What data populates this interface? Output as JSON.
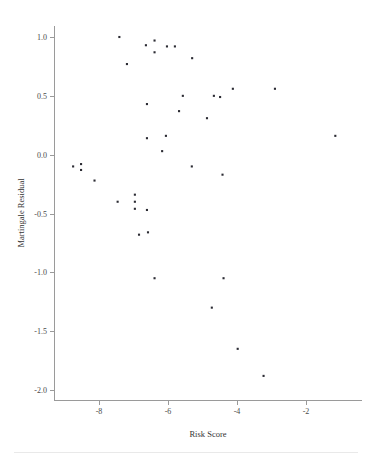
{
  "chart_data": {
    "type": "scatter",
    "title": "",
    "xlabel": "Risk Score",
    "ylabel": "Martingale Residual",
    "xlim": [
      -9.2,
      -0.8
    ],
    "ylim": [
      -2.15,
      1.15
    ],
    "xticks": [
      -8,
      -6,
      -4,
      -2
    ],
    "xticklabels": [
      "-8",
      "-6",
      "-4",
      "-2"
    ],
    "yticks": [
      1.0,
      0.5,
      0.0,
      -0.5,
      -1.0,
      -1.5,
      -2.0
    ],
    "yticklabels": [
      "1.0",
      "0.5",
      "0.0",
      "-0.5",
      "-1.0",
      "-1.5",
      "-2.0"
    ],
    "grid": false,
    "legend": null,
    "marker": "square",
    "marker_color": "#2b2b33",
    "marker_size": 2.1,
    "points": [
      {
        "x": -7.41,
        "y": 1.0
      },
      {
        "x": -6.39,
        "y": 0.97
      },
      {
        "x": -6.64,
        "y": 0.93
      },
      {
        "x": -6.03,
        "y": 0.92
      },
      {
        "x": -5.8,
        "y": 0.92
      },
      {
        "x": -6.39,
        "y": 0.87
      },
      {
        "x": -5.3,
        "y": 0.82
      },
      {
        "x": -7.19,
        "y": 0.77
      },
      {
        "x": -4.12,
        "y": 0.56
      },
      {
        "x": -2.9,
        "y": 0.56
      },
      {
        "x": -5.57,
        "y": 0.5
      },
      {
        "x": -4.67,
        "y": 0.5
      },
      {
        "x": -4.49,
        "y": 0.49
      },
      {
        "x": -6.61,
        "y": 0.43
      },
      {
        "x": -5.68,
        "y": 0.37
      },
      {
        "x": -4.87,
        "y": 0.31
      },
      {
        "x": -6.06,
        "y": 0.16
      },
      {
        "x": -1.15,
        "y": 0.16
      },
      {
        "x": -6.61,
        "y": 0.14
      },
      {
        "x": -6.17,
        "y": 0.03
      },
      {
        "x": -5.31,
        "y": -0.1
      },
      {
        "x": -8.75,
        "y": -0.1
      },
      {
        "x": -8.52,
        "y": -0.08
      },
      {
        "x": -8.52,
        "y": -0.13
      },
      {
        "x": -4.42,
        "y": -0.17
      },
      {
        "x": -8.13,
        "y": -0.22
      },
      {
        "x": -6.96,
        "y": -0.34
      },
      {
        "x": -7.46,
        "y": -0.4
      },
      {
        "x": -6.96,
        "y": -0.4
      },
      {
        "x": -6.96,
        "y": -0.46
      },
      {
        "x": -6.61,
        "y": -0.47
      },
      {
        "x": -6.84,
        "y": -0.68
      },
      {
        "x": -6.58,
        "y": -0.66
      },
      {
        "x": -6.39,
        "y": -1.05
      },
      {
        "x": -4.39,
        "y": -1.05
      },
      {
        "x": -4.73,
        "y": -1.3
      },
      {
        "x": -3.98,
        "y": -1.65
      },
      {
        "x": -3.23,
        "y": -1.88
      }
    ]
  },
  "axes": {
    "x_title": "Risk Score",
    "y_title": "Martingale Residual"
  }
}
